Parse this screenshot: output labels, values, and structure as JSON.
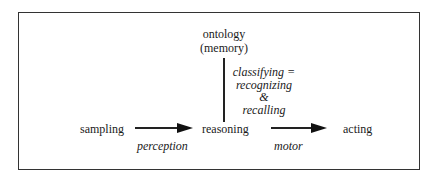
{
  "diagram": {
    "top_node": {
      "line1": "ontology",
      "line2": "(memory)"
    },
    "vertical_edge_label": {
      "line1": "classifying =",
      "line2": "recognizing",
      "line3": "&",
      "line4": "recalling"
    },
    "nodes": {
      "left": "sampling",
      "center": "reasoning",
      "right": "acting"
    },
    "edges": {
      "left_to_center": "perception",
      "center_to_right": "motor"
    },
    "colors": {
      "stroke": "#222222",
      "background": "#ffffff"
    }
  }
}
